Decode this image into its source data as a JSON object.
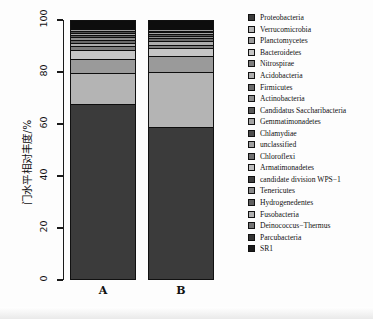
{
  "chart_data": {
    "type": "bar",
    "title": "",
    "subtitle": "",
    "xlabel": "",
    "ylabel": "门水平相对丰度/%",
    "ylim": [
      0,
      100
    ],
    "yticks": [
      0,
      20,
      40,
      60,
      80,
      100
    ],
    "grid": false,
    "stacked": true,
    "stack_total": 100,
    "legend_position": "right",
    "categories": [
      "A",
      "B"
    ],
    "series": [
      {
        "name": "Proteobacteria",
        "values": [
          69.0,
          59.5
        ],
        "color": "#3b3b3b"
      },
      {
        "name": "Verrucomicrobia",
        "values": [
          12.6,
          21.8
        ],
        "color": "#b4b4b4"
      },
      {
        "name": "Planctomycetes",
        "values": [
          5.5,
          6.4
        ],
        "color": "#9a9a9a"
      },
      {
        "name": "Bacteroidetes",
        "values": [
          3.4,
          3.0
        ],
        "color": "#c6c6c6"
      },
      {
        "name": "Nitrospirae",
        "values": [
          1.5,
          1.2
        ],
        "color": "#7d7d7d"
      },
      {
        "name": "Acidobacteria",
        "values": [
          1.4,
          1.6
        ],
        "color": "#aeaeae"
      },
      {
        "name": "Firmicutes",
        "values": [
          1.2,
          1.0
        ],
        "color": "#6a6a6a"
      },
      {
        "name": "Actinobacteria",
        "values": [
          1.1,
          0.9
        ],
        "color": "#8e8e8e"
      },
      {
        "name": "Candidatus Saccharibacteria",
        "values": [
          0.9,
          0.8
        ],
        "color": "#585858"
      },
      {
        "name": "Gemmatimonadetes",
        "values": [
          0.8,
          0.7
        ],
        "color": "#a4a4a4"
      },
      {
        "name": "Chlamydiae",
        "values": [
          0.7,
          0.6
        ],
        "color": "#4c4c4c"
      },
      {
        "name": "unclassified",
        "values": [
          0.6,
          0.6
        ],
        "color": "#9f9f9f"
      },
      {
        "name": "Chloroflexi",
        "values": [
          0.5,
          0.5
        ],
        "color": "#707070"
      },
      {
        "name": "Armatimonadetes",
        "values": [
          0.3,
          0.3
        ],
        "color": "#bdbdbd"
      },
      {
        "name": "candidate division WPS−1",
        "values": [
          0.2,
          0.3
        ],
        "color": "#3f3f3f"
      },
      {
        "name": "Tenericutes",
        "values": [
          0.1,
          0.2
        ],
        "color": "#898989"
      },
      {
        "name": "Hydrogenedentes",
        "values": [
          0.08,
          0.15
        ],
        "color": "#5f5f5f"
      },
      {
        "name": "Fusobacteria",
        "values": [
          0.06,
          0.1
        ],
        "color": "#b0b0b0"
      },
      {
        "name": "Deinococcus−Thermus",
        "values": [
          0.05,
          0.08
        ],
        "color": "#747474"
      },
      {
        "name": "Parcubacteria",
        "values": [
          0.03,
          0.05
        ],
        "color": "#333333"
      },
      {
        "name": "SR1",
        "values": [
          0.02,
          0.04
        ],
        "color": "#1c1c1c"
      }
    ]
  },
  "axes": {
    "y_label": "门水平相对丰度/%",
    "y_ticks": [
      "0",
      "20",
      "40",
      "60",
      "80",
      "100"
    ],
    "x_ticks": [
      "A",
      "B"
    ]
  },
  "footer": {
    "noise_text": ""
  }
}
